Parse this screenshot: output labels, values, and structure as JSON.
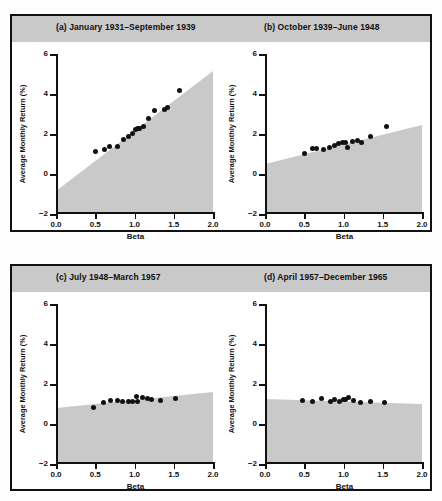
{
  "figure": {
    "axis_x_title": "Beta",
    "axis_y_title": "Average Monthly Return (%)",
    "shade_color": "#c9c9c9",
    "point_color": "#111111",
    "title_band_color": "#c9c9c9"
  },
  "chart_data": [
    {
      "type": "scatter",
      "panel": "a",
      "title": "(a) January 1931–September 1939",
      "xlabel": "Beta",
      "ylabel": "Average Monthly Return (%)",
      "xlim": [
        0.0,
        2.0
      ],
      "ylim": [
        -2,
        6
      ],
      "xticks": [
        "0.0",
        "0.5",
        "1.0",
        "1.5",
        "2.0"
      ],
      "yticks": [
        "6",
        "4",
        "2",
        "0",
        "−2"
      ],
      "grid": false,
      "legend": "none",
      "shaded_region": {
        "description": "region below fitted market line, shaded gray",
        "line_endpoints": [
          [
            0.0,
            -0.85
          ],
          [
            2.0,
            5.15
          ]
        ]
      },
      "points": [
        {
          "beta": 0.5,
          "return": 1.15
        },
        {
          "beta": 0.62,
          "return": 1.25
        },
        {
          "beta": 0.68,
          "return": 1.4
        },
        {
          "beta": 0.78,
          "return": 1.4
        },
        {
          "beta": 0.86,
          "return": 1.75
        },
        {
          "beta": 0.92,
          "return": 1.9
        },
        {
          "beta": 0.97,
          "return": 2.05
        },
        {
          "beta": 1.01,
          "return": 2.25
        },
        {
          "beta": 1.04,
          "return": 2.3
        },
        {
          "beta": 1.07,
          "return": 2.3
        },
        {
          "beta": 1.11,
          "return": 2.4
        },
        {
          "beta": 1.18,
          "return": 2.8
        },
        {
          "beta": 1.26,
          "return": 3.2
        },
        {
          "beta": 1.38,
          "return": 3.25
        },
        {
          "beta": 1.42,
          "return": 3.35
        },
        {
          "beta": 1.57,
          "return": 4.2
        }
      ]
    },
    {
      "type": "scatter",
      "panel": "b",
      "title": "(b) October 1939–June 1948",
      "xlabel": "Beta",
      "ylabel": "Average Monthly Return (%)",
      "xlim": [
        0.0,
        2.0
      ],
      "ylim": [
        -2,
        6
      ],
      "xticks": [
        "0.0",
        "0.5",
        "1.0",
        "1.5",
        "2.0"
      ],
      "yticks": [
        "6",
        "4",
        "2",
        "0",
        "−2"
      ],
      "grid": false,
      "legend": "none",
      "shaded_region": {
        "description": "region below fitted market line, shaded gray",
        "line_endpoints": [
          [
            0.0,
            0.5
          ],
          [
            2.0,
            2.45
          ]
        ]
      },
      "points": [
        {
          "beta": 0.5,
          "return": 1.05
        },
        {
          "beta": 0.6,
          "return": 1.3
        },
        {
          "beta": 0.66,
          "return": 1.3
        },
        {
          "beta": 0.75,
          "return": 1.25
        },
        {
          "beta": 0.82,
          "return": 1.35
        },
        {
          "beta": 0.88,
          "return": 1.45
        },
        {
          "beta": 0.94,
          "return": 1.55
        },
        {
          "beta": 0.99,
          "return": 1.6
        },
        {
          "beta": 1.02,
          "return": 1.6
        },
        {
          "beta": 1.05,
          "return": 1.35
        },
        {
          "beta": 1.11,
          "return": 1.65
        },
        {
          "beta": 1.18,
          "return": 1.7
        },
        {
          "beta": 1.23,
          "return": 1.6
        },
        {
          "beta": 1.35,
          "return": 1.9
        },
        {
          "beta": 1.55,
          "return": 2.4
        }
      ]
    },
    {
      "type": "scatter",
      "panel": "c",
      "title": "(c) July 1948–March 1957",
      "xlabel": "Beta",
      "ylabel": "Average Monthly Return (%)",
      "xlim": [
        0.0,
        2.0
      ],
      "ylim": [
        -2,
        6
      ],
      "xticks": [
        "0.0",
        "0.5",
        "1.0",
        "1.5",
        "2.0"
      ],
      "yticks": [
        "6",
        "4",
        "2",
        "0",
        "−2"
      ],
      "grid": false,
      "legend": "none",
      "shaded_region": {
        "description": "region below fitted market line, shaded gray",
        "line_endpoints": [
          [
            0.0,
            0.8
          ],
          [
            2.0,
            1.6
          ]
        ]
      },
      "points": [
        {
          "beta": 0.48,
          "return": 0.85
        },
        {
          "beta": 0.6,
          "return": 1.1
        },
        {
          "beta": 0.7,
          "return": 1.2
        },
        {
          "beta": 0.78,
          "return": 1.2
        },
        {
          "beta": 0.85,
          "return": 1.15
        },
        {
          "beta": 0.92,
          "return": 1.15
        },
        {
          "beta": 0.97,
          "return": 1.12
        },
        {
          "beta": 1.02,
          "return": 1.4
        },
        {
          "beta": 1.04,
          "return": 1.15
        },
        {
          "beta": 1.1,
          "return": 1.35
        },
        {
          "beta": 1.17,
          "return": 1.3
        },
        {
          "beta": 1.22,
          "return": 1.25
        },
        {
          "beta": 1.33,
          "return": 1.2
        },
        {
          "beta": 1.52,
          "return": 1.28
        }
      ]
    },
    {
      "type": "scatter",
      "panel": "d",
      "title": "(d) April 1957–December 1965",
      "xlabel": "Beta",
      "ylabel": "Average Monthly Return (%)",
      "xlim": [
        0.0,
        2.0
      ],
      "ylim": [
        -2,
        6
      ],
      "xticks": [
        "0.0",
        "0.5",
        "1.0",
        "1.5",
        "2.0"
      ],
      "yticks": [
        "6",
        "4",
        "2",
        "0",
        "−2"
      ],
      "grid": false,
      "legend": "none",
      "shaded_region": {
        "description": "region below fitted market line, shaded gray",
        "line_endpoints": [
          [
            0.0,
            1.25
          ],
          [
            2.0,
            1.0
          ]
        ]
      },
      "points": [
        {
          "beta": 0.48,
          "return": 1.18
        },
        {
          "beta": 0.6,
          "return": 1.15
        },
        {
          "beta": 0.72,
          "return": 1.3
        },
        {
          "beta": 0.84,
          "return": 1.15
        },
        {
          "beta": 0.89,
          "return": 1.22
        },
        {
          "beta": 0.95,
          "return": 1.15
        },
        {
          "beta": 1.0,
          "return": 1.25
        },
        {
          "beta": 1.03,
          "return": 1.22
        },
        {
          "beta": 1.07,
          "return": 1.32
        },
        {
          "beta": 1.13,
          "return": 1.18
        },
        {
          "beta": 1.22,
          "return": 1.1
        },
        {
          "beta": 1.34,
          "return": 1.12
        },
        {
          "beta": 1.52,
          "return": 1.1
        }
      ]
    }
  ]
}
